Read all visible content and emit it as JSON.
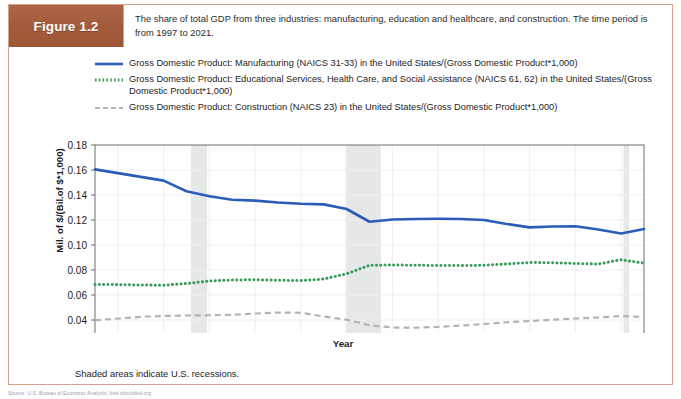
{
  "figure": {
    "badge_label": "Figure 1.2",
    "caption": "The share of total GDP from three industries: manufacturing, education and healthcare, and construction. The time period is from 1997 to 2021.",
    "footnote": "Shaded areas indicate U.S. recessions.",
    "source_strip": "Source: U.S. Bureau of Economic Analysis, fred.stlouisfed.org",
    "badge_color": "#a85f3e",
    "border_color": "#d6a18c"
  },
  "legend": {
    "position": "above-plot",
    "entries": [
      {
        "label": "Gross Domestic Product: Manufacturing (NAICS 31-33) in the United States/(Gross Domestic Product*1,000)",
        "color": "#2b5cb8",
        "style": "solid",
        "swatch_name": "legend-swatch-solid-blue"
      },
      {
        "label": "Gross Domestic Product: Educational Services, Health Care, and Social Assistance (NAICS 61, 62) in the United States/(Gross Domestic Product*1,000)",
        "color": "#3a9a5c",
        "style": "dotted",
        "swatch_name": "legend-swatch-dotted-green"
      },
      {
        "label": "Gross Domestic Product: Construction (NAICS 23) in the United States/(Gross Domestic Product*1,000)",
        "color": "#b3b3b3",
        "style": "dashed",
        "swatch_name": "legend-swatch-dashed-gray"
      }
    ]
  },
  "chart_data": {
    "type": "line",
    "title": "",
    "xlabel": "Year",
    "ylabel": "Mil. of $/(Bil.of $*1,000)",
    "xlim": [
      1997,
      2021
    ],
    "ylim": [
      0.02,
      0.18
    ],
    "xticks": [
      1998,
      2000,
      2002,
      2004,
      2006,
      2008,
      2010,
      2012,
      2014,
      2016,
      2018,
      2020
    ],
    "yticks": [
      0.02,
      0.04,
      0.06,
      0.08,
      0.1,
      0.12,
      0.14,
      0.16,
      0.18
    ],
    "ytick_labels": [
      "0.02",
      "0.04",
      "0.06",
      "0.08",
      "0.10",
      "0.12",
      "0.14",
      "0.16",
      "0.18"
    ],
    "grid": true,
    "x": [
      1997,
      1998,
      1999,
      2000,
      2001,
      2002,
      2003,
      2004,
      2005,
      2006,
      2007,
      2008,
      2009,
      2010,
      2011,
      2012,
      2013,
      2014,
      2015,
      2016,
      2017,
      2018,
      2019,
      2020,
      2021
    ],
    "series": [
      {
        "name": "Gross Domestic Product: Manufacturing (NAICS 31-33) in the United States/(Gross Domestic Product*1,000)",
        "color": "#2b5cb8",
        "style": "solid",
        "values": [
          0.1605,
          0.1575,
          0.1545,
          0.1515,
          0.143,
          0.139,
          0.1362,
          0.1355,
          0.134,
          0.133,
          0.1325,
          0.1288,
          0.1186,
          0.1204,
          0.1208,
          0.121,
          0.1208,
          0.12,
          0.1168,
          0.1141,
          0.1148,
          0.115,
          0.1124,
          0.1092,
          0.1128
        ]
      },
      {
        "name": "Gross Domestic Product: Educational Services, Health Care, and Social Assistance (NAICS 61, 62) in the United States/(Gross Domestic Product*1,000)",
        "color": "#3a9a5c",
        "style": "dotted",
        "values": [
          0.0685,
          0.0683,
          0.068,
          0.0678,
          0.0692,
          0.0712,
          0.072,
          0.0722,
          0.0718,
          0.0715,
          0.0728,
          0.077,
          0.0838,
          0.084,
          0.0838,
          0.0836,
          0.0835,
          0.0838,
          0.0848,
          0.086,
          0.0858,
          0.0852,
          0.0848,
          0.0882,
          0.0855
        ]
      },
      {
        "name": "Gross Domestic Product: Construction (NAICS 23) in the United States/(Gross Domestic Product*1,000)",
        "color": "#b3b3b3",
        "style": "dashed",
        "values": [
          0.0398,
          0.0412,
          0.0425,
          0.0432,
          0.0436,
          0.0438,
          0.0442,
          0.0452,
          0.046,
          0.0458,
          0.0428,
          0.0402,
          0.0358,
          0.034,
          0.0338,
          0.0345,
          0.0355,
          0.0368,
          0.0382,
          0.0392,
          0.0402,
          0.0412,
          0.042,
          0.0432,
          0.0424
        ]
      }
    ],
    "recession_bands": [
      {
        "start": 2001.2,
        "end": 2001.9,
        "label": "2001 recession"
      },
      {
        "start": 2007.95,
        "end": 2009.5,
        "label": "2008-2009 recession"
      },
      {
        "start": 2020.1,
        "end": 2020.35,
        "label": "2020 recession"
      }
    ],
    "band_color": "#e6e8e8"
  }
}
